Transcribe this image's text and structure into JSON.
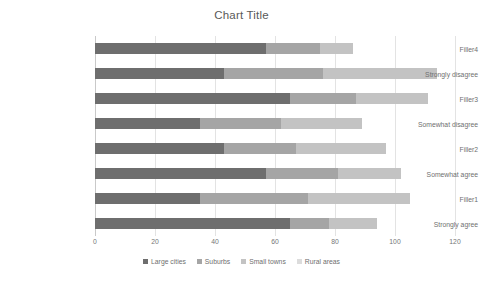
{
  "chart_data": {
    "type": "bar",
    "orientation": "horizontal",
    "stacked": true,
    "title": "Chart Title",
    "xlabel": "",
    "ylabel": "",
    "xlim": [
      0,
      120
    ],
    "xticks": [
      0,
      20,
      40,
      60,
      80,
      100,
      120
    ],
    "grid": true,
    "legend_position": "bottom",
    "categories": [
      "Strongly agree",
      "Filler1",
      "Somewhat agree",
      "Filler2",
      "Somewhat disagree",
      "Filler3",
      "Strongly disagree",
      "Filler4"
    ],
    "categories_top_to_bottom": [
      "Filler4",
      "Strongly disagree",
      "Filler3",
      "Somewhat disagree",
      "Filler2",
      "Somewhat agree",
      "Filler1",
      "Strongly agree"
    ],
    "series": [
      {
        "name": "Large cities",
        "color": "#6E6E6E",
        "values": [
          65,
          35,
          57,
          43,
          35,
          65,
          43,
          57
        ]
      },
      {
        "name": "Suburbs",
        "color": "#A5A5A5",
        "values": [
          13,
          36,
          24,
          24,
          27,
          22,
          33,
          18
        ]
      },
      {
        "name": "Small towns",
        "color": "#C3C3C3",
        "values": [
          16,
          34,
          21,
          30,
          27,
          24,
          38,
          11
        ]
      },
      {
        "name": "Rural areas",
        "color": "#DCDCDC",
        "values": [
          0,
          0,
          0,
          0,
          0,
          0,
          0,
          0
        ]
      }
    ],
    "totals_top_to_bottom": [
      86,
      114,
      111,
      89,
      97,
      102,
      105,
      94
    ]
  },
  "legend": {
    "items": [
      {
        "label": "Large cities",
        "color": "#6E6E6E"
      },
      {
        "label": "Suburbs",
        "color": "#A5A5A5"
      },
      {
        "label": "Small towns",
        "color": "#C3C3C3"
      },
      {
        "label": "Rural areas",
        "color": "#DCDCDC"
      }
    ]
  },
  "axis": {
    "x_tick_labels": [
      "0",
      "20",
      "40",
      "60",
      "80",
      "100",
      "120"
    ]
  },
  "bars_top_to_bottom": [
    {
      "category": "Filler4",
      "segments": [
        57,
        18,
        11,
        0
      ]
    },
    {
      "category": "Strongly disagree",
      "segments": [
        43,
        33,
        38,
        0
      ]
    },
    {
      "category": "Filler3",
      "segments": [
        65,
        22,
        24,
        0
      ]
    },
    {
      "category": "Somewhat disagree",
      "segments": [
        35,
        27,
        27,
        0
      ]
    },
    {
      "category": "Filler2",
      "segments": [
        43,
        24,
        30,
        0
      ]
    },
    {
      "category": "Somewhat agree",
      "segments": [
        57,
        24,
        21,
        0
      ]
    },
    {
      "category": "Filler1",
      "segments": [
        35,
        36,
        34,
        0
      ]
    },
    {
      "category": "Strongly agree",
      "segments": [
        65,
        13,
        16,
        0
      ]
    }
  ]
}
